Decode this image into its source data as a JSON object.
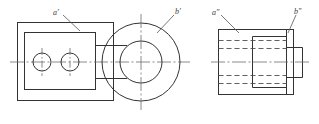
{
  "drawing": {
    "title": "Orthographic projection of a bearing block",
    "sheet_width": 319,
    "sheet_height": 124,
    "background_color": "#ffffff",
    "line_color": "#333333",
    "hidden_line_color": "#555555",
    "center_line_color": "#666666",
    "leader_color": "#555555",
    "labels": {
      "front_face": "a′",
      "front_circle": "b′",
      "side_face": "a″",
      "side_step": "b″"
    },
    "views": [
      {
        "name": "front-view",
        "label": "Front view",
        "outer_rect": {
          "x": 17,
          "y": 22,
          "width": 97,
          "height": 79
        },
        "inner_rect": {
          "x": 24,
          "y": 32,
          "width": 72,
          "height": 58
        },
        "holes": [
          {
            "cx": 42,
            "cy": 62,
            "r": 9
          },
          {
            "cx": 70,
            "cy": 62,
            "r": 9
          }
        ],
        "boss_outer_circle": {
          "cx": 141,
          "cy": 62,
          "r": 39
        },
        "boss_inner_circle": {
          "cx": 141,
          "cy": 62,
          "r": 21
        },
        "tangent_lines_y": [
          45,
          79
        ]
      },
      {
        "name": "side-view",
        "label": "Side view",
        "body_rect": {
          "x": 218,
          "y": 29,
          "width": 76,
          "height": 66
        },
        "boss_rect": {
          "x": 252,
          "y": 36,
          "width": 34,
          "height": 52
        },
        "step_rect": {
          "x": 286,
          "y": 47,
          "width": 16,
          "height": 30
        },
        "hidden_lines_y": [
          40,
          48,
          76,
          84
        ],
        "vertical_split_x": 286
      }
    ]
  }
}
